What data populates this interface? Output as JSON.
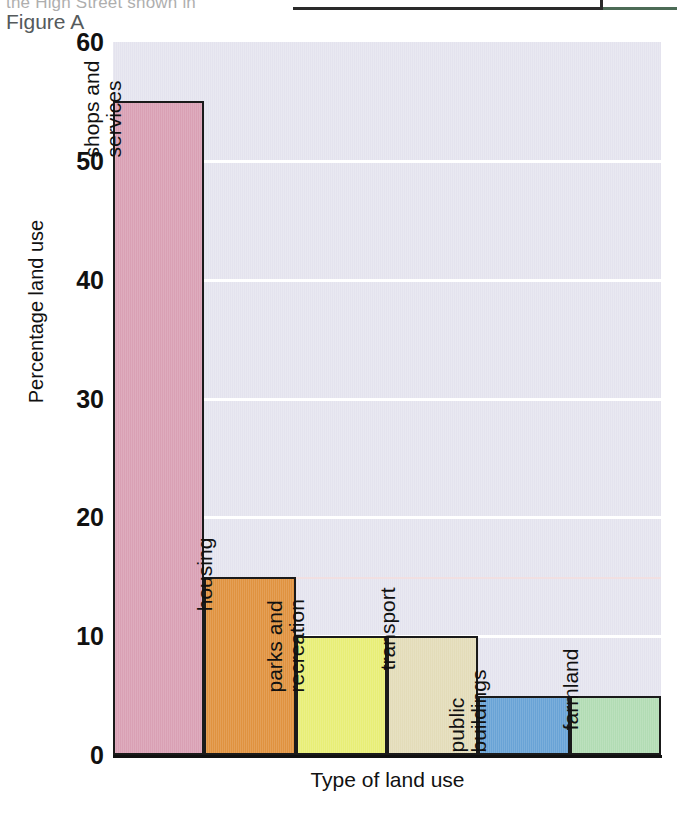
{
  "page": {
    "cut_text": "the High Street shown in",
    "figure_caption": "Figure A"
  },
  "chart_data": {
    "type": "bar",
    "title": "",
    "xlabel": "Type of land use",
    "ylabel": "Percentage land use",
    "ylim": [
      0,
      60
    ],
    "yticks": [
      "60",
      "50",
      "40",
      "30",
      "20",
      "10",
      "0"
    ],
    "ytick_values": [
      60,
      50,
      40,
      30,
      20,
      10,
      0
    ],
    "grid": true,
    "legend": "none",
    "categories": [
      "shops and services",
      "housing",
      "parks and recreation",
      "transport",
      "public buildings",
      "farmland"
    ],
    "values": [
      55,
      15,
      10,
      10,
      5,
      5
    ],
    "bar_labels": [
      [
        "shops and",
        "services"
      ],
      [
        "housing"
      ],
      [
        "parks and",
        "recreation"
      ],
      [
        "transport"
      ],
      [
        "public",
        "buildings"
      ],
      [
        "farmland"
      ]
    ],
    "colors": [
      "#d9a0b4",
      "#e0923f",
      "#e8ee76",
      "#e3dcb9",
      "#69a3d6",
      "#b2dcb4"
    ],
    "plot_background": "#e4e3ee",
    "gridline_color": "#ffffff",
    "bar_edge_color": "#1a1a1a"
  }
}
